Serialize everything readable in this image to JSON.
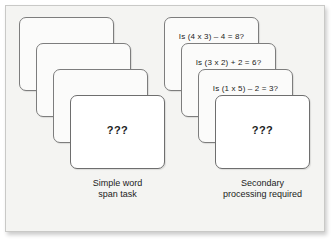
{
  "figure": {
    "background_color": "#f4f4f2",
    "border_color": "#c9c9c7",
    "card_fill": "#fbfbfa",
    "card_border": "#7d7d7d",
    "text_color": "#1b1b1b"
  },
  "left_panel": {
    "caption_line1": "Simple word",
    "caption_line2": "span task",
    "cards": [
      {
        "word": "PILL"
      },
      {
        "word": "TREE"
      },
      {
        "word": "LOCK"
      },
      {
        "word": "???"
      }
    ]
  },
  "right_panel": {
    "caption_line1": "Secondary",
    "caption_line2": "processing required",
    "cards": [
      {
        "equation": "Is (4 x 3) – 4 = 8?",
        "word": "PILL"
      },
      {
        "equation": "Is (3 x 2) + 2 = 6?",
        "word": "TREE"
      },
      {
        "equation": "Is (1 x 5) – 2 = 3?",
        "word": "LOCK"
      },
      {
        "word": "???"
      }
    ]
  }
}
